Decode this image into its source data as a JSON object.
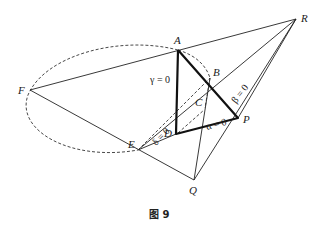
{
  "figure": {
    "caption": "图 9",
    "points": {
      "A": {
        "label": "A",
        "x": 178,
        "y": 50
      },
      "B": {
        "label": "B",
        "x": 210,
        "y": 78
      },
      "C": {
        "label": "C",
        "x": 205,
        "y": 108
      },
      "D": {
        "label": "D",
        "x": 176,
        "y": 134
      },
      "E": {
        "label": "E",
        "x": 138,
        "y": 150
      },
      "F": {
        "label": "F",
        "x": 30,
        "y": 90
      },
      "P": {
        "label": "P",
        "x": 238,
        "y": 118
      },
      "Q": {
        "label": "Q",
        "x": 194,
        "y": 180
      },
      "R": {
        "label": "R",
        "x": 296,
        "y": 19
      }
    },
    "line_labels": {
      "gamma": "γ = 0",
      "beta": "β = 0",
      "alpha": "α = 0",
      "delta": "δ = 0"
    }
  }
}
